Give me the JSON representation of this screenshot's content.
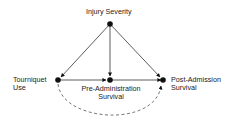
{
  "diagram": {
    "type": "causal-dag",
    "nodes": [
      {
        "id": "injury",
        "label": "Injury Severity",
        "x": 110,
        "y": 24
      },
      {
        "id": "tourniquet",
        "label_line1": "Tourniquet",
        "label_line2": "Use",
        "x": 58,
        "y": 80
      },
      {
        "id": "pre",
        "label_line1": "Pre-Administration",
        "label_line2": "Survival",
        "x": 110,
        "y": 80
      },
      {
        "id": "post",
        "label_line1": "Post-Admission",
        "label_line2": "Survival",
        "x": 163,
        "y": 80
      }
    ],
    "edges": [
      {
        "from": "injury",
        "to": "tourniquet",
        "style": "solid"
      },
      {
        "from": "injury",
        "to": "pre",
        "style": "solid"
      },
      {
        "from": "injury",
        "to": "post",
        "style": "solid"
      },
      {
        "from": "tourniquet",
        "to": "pre",
        "style": "solid"
      },
      {
        "from": "pre",
        "to": "post",
        "style": "solid"
      },
      {
        "from": "tourniquet",
        "to": "post",
        "style": "dashed",
        "curved": true
      }
    ],
    "colors": {
      "line": "#2a2a2a",
      "node": "#111111",
      "dashed": "#555555"
    }
  },
  "labels": {
    "injury": "Injury Severity",
    "tourniquet_1": "Tourniquet",
    "tourniquet_2": "Use",
    "pre_1": "Pre-Administration",
    "pre_2": "Survival",
    "post_1": "Post-Admission",
    "post_2": "Survival"
  }
}
